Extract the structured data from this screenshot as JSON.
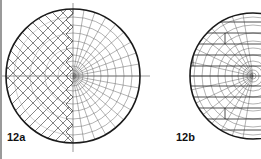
{
  "figures": [
    {
      "id": "12a",
      "label": "12a",
      "cx": 73,
      "cy": 76,
      "r": 67,
      "pattern": "left half diagonal lattice, right half polar grid"
    },
    {
      "id": "12b",
      "label": "12b",
      "cx": 253,
      "cy": 76,
      "r": 63,
      "pattern": "horizontal bands with offset circular grid"
    }
  ],
  "colors": {
    "stroke": "#1a1a1a",
    "grid": "#555555",
    "background": "#ffffff"
  }
}
